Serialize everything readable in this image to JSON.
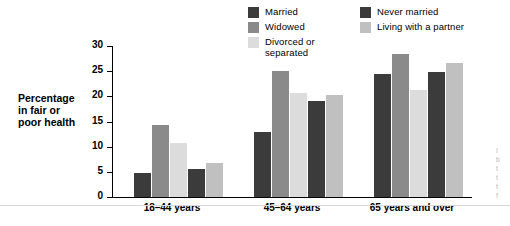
{
  "legend": {
    "columns": [
      [
        {
          "label": "Married",
          "color": "#3b3b3b"
        },
        {
          "label": "Widowed",
          "color": "#8a8a8a"
        },
        {
          "label": "Divorced or\nseparated",
          "color": "#dcdcdc"
        }
      ],
      [
        {
          "label": "Never married",
          "color": "#3b3b3b"
        },
        {
          "label": "Living with a partner",
          "color": "#c0c0c0"
        }
      ]
    ]
  },
  "axis": {
    "y_title": "Percentage\nin fair or\npoor health",
    "y_ticks": [
      "0",
      "5",
      "10",
      "15",
      "20",
      "25",
      "30"
    ]
  },
  "side_note": "I\nb\nt\nt\nt\nf",
  "chart_data": {
    "type": "bar",
    "title": "",
    "xlabel": "",
    "ylabel": "Percentage in fair or poor health",
    "ylim": [
      0,
      30
    ],
    "grid": false,
    "legend_position": "top-right",
    "categories": [
      "18–44 years",
      "45–64 years",
      "65 years and over"
    ],
    "series": [
      {
        "name": "Married",
        "color": "#3b3b3b",
        "values": [
          4.7,
          13.0,
          24.5
        ]
      },
      {
        "name": "Widowed",
        "color": "#8a8a8a",
        "values": [
          14.3,
          25.0,
          28.4
        ]
      },
      {
        "name": "Divorced or separated",
        "color": "#dcdcdc",
        "values": [
          10.7,
          20.7,
          21.3
        ]
      },
      {
        "name": "Never married",
        "color": "#3b3b3b",
        "values": [
          5.5,
          19.0,
          24.8
        ]
      },
      {
        "name": "Living with a partner",
        "color": "#c0c0c0",
        "values": [
          6.7,
          20.2,
          26.6
        ]
      }
    ]
  }
}
